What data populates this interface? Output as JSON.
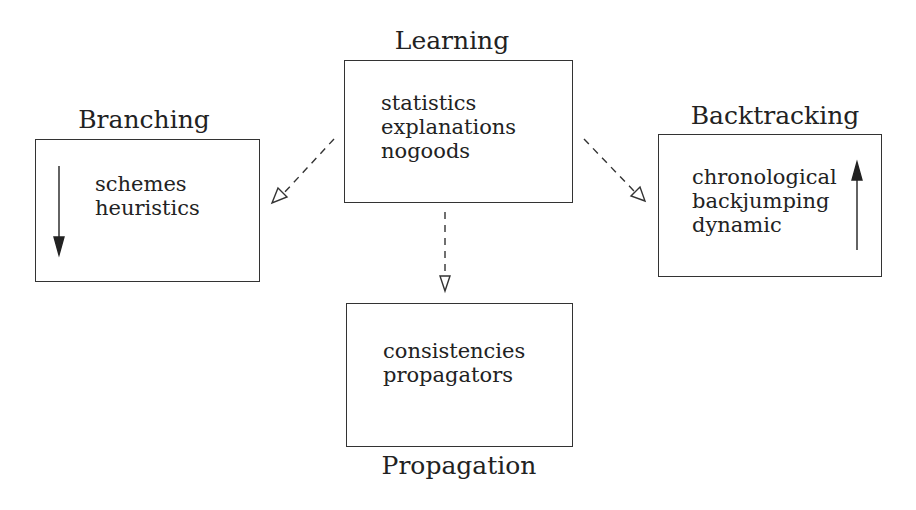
{
  "diagram": {
    "nodes": [
      {
        "id": "learning",
        "title": "Learning",
        "items": [
          "statistics",
          "explanations",
          "nogoods"
        ]
      },
      {
        "id": "branching",
        "title": "Branching",
        "items": [
          "schemes",
          "heuristics"
        ],
        "inner_arrow": "down"
      },
      {
        "id": "backtracking",
        "title": "Backtracking",
        "items": [
          "chronological",
          "backjumping",
          "dynamic"
        ],
        "inner_arrow": "up"
      },
      {
        "id": "propagation",
        "title": "Propagation",
        "items": [
          "consistencies",
          "propagators"
        ]
      }
    ],
    "edges": [
      {
        "from": "learning",
        "to": "branching",
        "style": "dashed",
        "head": "open-triangle"
      },
      {
        "from": "learning",
        "to": "backtracking",
        "style": "dashed",
        "head": "open-triangle"
      },
      {
        "from": "learning",
        "to": "propagation",
        "style": "dashed",
        "head": "open-triangle"
      }
    ]
  },
  "colors": {
    "line": "#333333",
    "text": "#222222",
    "background": "#ffffff"
  }
}
